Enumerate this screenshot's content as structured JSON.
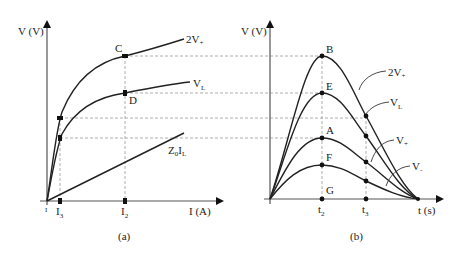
{
  "figure": {
    "panel_a": {
      "caption": "(a)",
      "y_axis_label": "V (V)",
      "x_axis_label": "I (A)",
      "origin_label": "I",
      "x_ticks": [
        {
          "id": "I3",
          "main": "I",
          "sub": "3"
        },
        {
          "id": "I2",
          "main": "I",
          "sub": "2"
        }
      ],
      "curves": [
        {
          "id": "2V+",
          "main": "2V",
          "sub": "+"
        },
        {
          "id": "VL",
          "main": "V",
          "sub": "L"
        },
        {
          "id": "Z0IL",
          "main": "Z",
          "sub": "0",
          "main2": "I",
          "sub2": "L"
        }
      ],
      "points": [
        {
          "id": "C",
          "label": "C"
        },
        {
          "id": "D",
          "label": "D"
        }
      ]
    },
    "panel_b": {
      "caption": "(b)",
      "y_axis_label": "V (V)",
      "x_axis_label": "t (s)",
      "x_ticks": [
        {
          "id": "t2",
          "main": "t",
          "sub": "2"
        },
        {
          "id": "t3",
          "main": "t",
          "sub": "3"
        }
      ],
      "curves": [
        {
          "id": "2V+",
          "main": "2V",
          "sub": "+"
        },
        {
          "id": "VL",
          "main": "V",
          "sub": "L"
        },
        {
          "id": "V+",
          "main": "V",
          "sub": "+"
        },
        {
          "id": "V-",
          "main": "V",
          "sub": "-"
        }
      ],
      "points": [
        {
          "id": "B",
          "label": "B"
        },
        {
          "id": "E",
          "label": "E"
        },
        {
          "id": "A",
          "label": "A"
        },
        {
          "id": "F",
          "label": "F"
        },
        {
          "id": "G",
          "label": "G"
        }
      ]
    }
  }
}
